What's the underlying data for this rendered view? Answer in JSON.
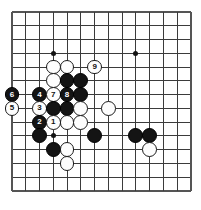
{
  "figure": {
    "kind": "go-board-diagram",
    "board": {
      "columns": 14,
      "rows": 14,
      "origin_x": 12,
      "origin_y": 12,
      "spacing": 13.77,
      "line_color": "#3b3b3b",
      "border_color": "#555555",
      "background_color": "#ffffff",
      "black_color": "#141414",
      "white_color": "#fdfdfd"
    },
    "star_points": [
      {
        "col": 3,
        "row": 3
      },
      {
        "col": 9,
        "row": 3
      },
      {
        "col": 3,
        "row": 9
      },
      {
        "col": 9,
        "row": 9
      }
    ],
    "stones": [
      {
        "col": 3,
        "row": 4,
        "color": "white",
        "label": ""
      },
      {
        "col": 4,
        "row": 4,
        "color": "white",
        "label": ""
      },
      {
        "col": 6,
        "row": 4,
        "color": "white",
        "label": "9"
      },
      {
        "col": 3,
        "row": 5,
        "color": "white",
        "label": ""
      },
      {
        "col": 4,
        "row": 5,
        "color": "black",
        "label": ""
      },
      {
        "col": 5,
        "row": 5,
        "color": "black",
        "label": ""
      },
      {
        "col": 0,
        "row": 6,
        "color": "black",
        "label": "6"
      },
      {
        "col": 2,
        "row": 6,
        "color": "black",
        "label": "4"
      },
      {
        "col": 3,
        "row": 6,
        "color": "white",
        "label": "7"
      },
      {
        "col": 4,
        "row": 6,
        "color": "black",
        "label": "8"
      },
      {
        "col": 5,
        "row": 6,
        "color": "black",
        "label": ""
      },
      {
        "col": 0,
        "row": 7,
        "color": "white",
        "label": "5"
      },
      {
        "col": 2,
        "row": 7,
        "color": "white",
        "label": "3"
      },
      {
        "col": 3,
        "row": 7,
        "color": "black",
        "label": ""
      },
      {
        "col": 4,
        "row": 7,
        "color": "black",
        "label": ""
      },
      {
        "col": 5,
        "row": 7,
        "color": "white",
        "label": ""
      },
      {
        "col": 7,
        "row": 7,
        "color": "white",
        "label": ""
      },
      {
        "col": 2,
        "row": 8,
        "color": "black",
        "label": "2"
      },
      {
        "col": 3,
        "row": 8,
        "color": "white",
        "label": "1"
      },
      {
        "col": 4,
        "row": 8,
        "color": "white",
        "label": ""
      },
      {
        "col": 5,
        "row": 8,
        "color": "white",
        "label": ""
      },
      {
        "col": 2,
        "row": 9,
        "color": "black",
        "label": ""
      },
      {
        "col": 6,
        "row": 9,
        "color": "black",
        "label": ""
      },
      {
        "col": 9,
        "row": 9,
        "color": "black",
        "label": ""
      },
      {
        "col": 10,
        "row": 9,
        "color": "black",
        "label": ""
      },
      {
        "col": 3,
        "row": 10,
        "color": "black",
        "label": ""
      },
      {
        "col": 4,
        "row": 10,
        "color": "white",
        "label": ""
      },
      {
        "col": 10,
        "row": 10,
        "color": "white",
        "label": ""
      },
      {
        "col": 4,
        "row": 11,
        "color": "white",
        "label": ""
      }
    ],
    "move_sequence": [
      {
        "number": "1",
        "color": "white"
      },
      {
        "number": "2",
        "color": "black"
      },
      {
        "number": "3",
        "color": "white"
      },
      {
        "number": "4",
        "color": "black"
      },
      {
        "number": "5",
        "color": "white"
      },
      {
        "number": "6",
        "color": "black"
      },
      {
        "number": "7",
        "color": "white"
      },
      {
        "number": "8",
        "color": "black"
      },
      {
        "number": "9",
        "color": "white"
      }
    ]
  }
}
